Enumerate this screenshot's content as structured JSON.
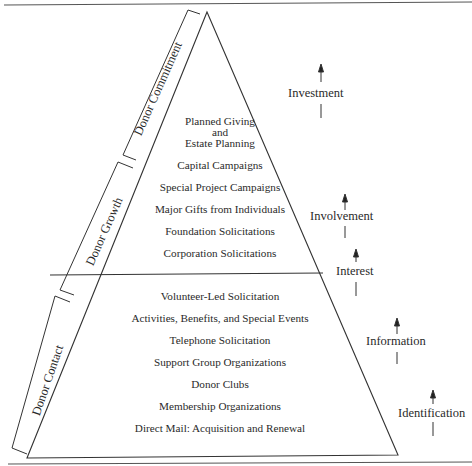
{
  "diagram": {
    "type": "pyramid",
    "phases": [
      {
        "label": "Donor Commitment"
      },
      {
        "label": "Donor Growth"
      },
      {
        "label": "Donor Contact"
      }
    ],
    "upper_section": {
      "items": [
        {
          "label": "Planned Giving"
        },
        {
          "label": "and"
        },
        {
          "label": "Estate Planning"
        },
        {
          "label": "Capital Campaigns"
        },
        {
          "label": "Special Project Campaigns"
        },
        {
          "label": "Major Gifts from Individuals"
        },
        {
          "label": "Foundation Solicitations"
        },
        {
          "label": "Corporation Solicitations"
        }
      ]
    },
    "lower_section": {
      "items": [
        {
          "label": "Volunteer-Led Solicitation"
        },
        {
          "label": "Activities, Benefits, and Special Events"
        },
        {
          "label": "Telephone Solicitation"
        },
        {
          "label": "Support Group Organizations"
        },
        {
          "label": "Donor Clubs"
        },
        {
          "label": "Membership Organizations"
        },
        {
          "label": "Direct Mail: Acquisition and Renewal"
        }
      ]
    },
    "stages": [
      {
        "label": "Investment",
        "icon": "arrow-up-icon"
      },
      {
        "label": "Involvement",
        "icon": "arrow-up-icon"
      },
      {
        "label": "Interest",
        "icon": "arrow-up-icon"
      },
      {
        "label": "Information",
        "icon": "arrow-up-icon"
      },
      {
        "label": "Identification",
        "icon": "arrow-up-icon"
      }
    ],
    "colors": {
      "line": "#333333",
      "text": "#2a2a2a",
      "background": "#ffffff"
    }
  }
}
